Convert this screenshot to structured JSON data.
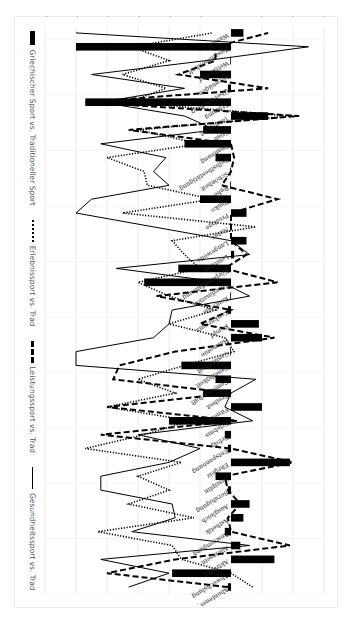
{
  "chart_data": {
    "type": "bar+line",
    "orientation": "rotated 90 degrees clockwise in the screenshot",
    "title": "",
    "xlabel": "",
    "ylabel": "",
    "ylim": [
      -0.6,
      0.3
    ],
    "yticks": [
      "0,3",
      "0,2",
      "0,1",
      "0",
      "-0,1",
      "-0,2",
      "-0,3",
      "-0,4",
      "-0,5",
      "-0,6"
    ],
    "grid": true,
    "legend_position": "bottom (left side after rotation)",
    "legend": [
      {
        "name": "Griechischer Sport vs. Traditioneller Sport",
        "style": "bar"
      },
      {
        "name": "Erlebnissport vs. Trad",
        "style": "dotted-line"
      },
      {
        "name": "Leistungssport vs. Trad",
        "style": "dashed-line"
      },
      {
        "name": "Gesundheitssport vs. Trad",
        "style": "solid-line"
      }
    ],
    "categories": [
      "Abenteuer_Wagnis",
      "Abwechslung",
      "Aktivität",
      "Alleinsein",
      "Anstrengung",
      "Ästhetik",
      "Ausgleich",
      "Beruhigung",
      "Disziplin",
      "Ehrgeiz",
      "Entspannung",
      "Erfolg",
      "Erlebnis",
      "Fitness",
      "Freiheit",
      "Gemeinschaft",
      "Geselligkeit",
      "Gesundheit",
      "Harmonie",
      "Kampf",
      "Konkurrenz",
      "Kontrolle",
      "Koordination",
      "Körpererfahrung",
      "Leistung",
      "Langeweile",
      "Natur",
      "Prestige",
      "Risiko",
      "Ruhe",
      "Schönheit",
      "Selbstbestätigung",
      "Spannung",
      "Spaß",
      "Teamgeist",
      "Training",
      "Überwindung",
      "Vergnügen",
      "Wettkampf",
      "Zusammenhalt",
      "Wasser"
    ],
    "series": [
      {
        "name": "Griechischer Sport vs. Traditioneller Sport",
        "type": "bar",
        "values": [
          -0.01,
          -0.19,
          0.14,
          0.03,
          -0.02,
          0.04,
          0.06,
          -0.01,
          -0.05,
          0.19,
          -0.01,
          -0.02,
          -0.2,
          0.1,
          -0.09,
          -0.05,
          -0.16,
          0.0,
          0.1,
          0.09,
          -0.01,
          0.0,
          -0.28,
          -0.17,
          0.01,
          0.05,
          0.0,
          0.05,
          -0.1,
          0.0,
          0.0,
          -0.05,
          -0.15,
          -0.09,
          0.12,
          -0.47,
          -0.01,
          -0.1,
          0.0,
          -0.5,
          0.04
        ]
      },
      {
        "name": "Erlebnissport vs. Trad",
        "type": "line",
        "style": "dotted",
        "values": [
          0.07,
          0.0,
          -0.16,
          -0.19,
          -0.43,
          -0.12,
          -0.33,
          -0.2,
          -0.3,
          -0.16,
          -0.47,
          -0.28,
          -0.13,
          -0.4,
          -0.18,
          -0.3,
          -0.15,
          0.01,
          -0.02,
          -0.2,
          -0.05,
          -0.2,
          -0.3,
          -0.1,
          -0.15,
          -0.19,
          0.08,
          -0.35,
          -0.06,
          -0.27,
          -0.28,
          -0.4,
          -0.1,
          -0.3,
          0.19,
          -0.33,
          -0.21,
          -0.35,
          -0.2,
          -0.32,
          -0.06
        ]
      },
      {
        "name": "Leistungssport vs. Trad",
        "type": "line",
        "style": "dashed",
        "values": [
          -0.01,
          -0.4,
          -0.18,
          0.19,
          0.0,
          -0.01,
          0.03,
          -0.01,
          -0.02,
          0.2,
          0.0,
          -0.42,
          0.02,
          -0.4,
          0.0,
          -0.38,
          -0.36,
          -0.18,
          0.14,
          -0.1,
          0.0,
          -0.24,
          0.15,
          -0.02,
          0.05,
          0.0,
          0.0,
          0.0,
          0.15,
          -0.03,
          0.0,
          0.01,
          0.0,
          -0.33,
          0.22,
          -0.47,
          0.12,
          -0.17,
          -0.05,
          -0.05,
          0.12
        ]
      },
      {
        "name": "Gesundheitssport vs. Trad",
        "type": "line",
        "style": "solid",
        "values": [
          -0.33,
          -0.2,
          -0.42,
          0.06,
          -0.32,
          -0.18,
          -0.19,
          -0.42,
          -0.42,
          -0.2,
          -0.1,
          -0.3,
          0.07,
          -0.02,
          0.0,
          0.08,
          -0.5,
          -0.5,
          -0.25,
          -0.2,
          -0.19,
          0.06,
          -0.03,
          -0.37,
          0.06,
          0.0,
          -0.25,
          -0.5,
          -0.45,
          -0.2,
          -0.25,
          -0.21,
          -0.42,
          -0.05,
          -0.15,
          -0.42,
          -0.15,
          -0.45,
          -0.08,
          0.25,
          -0.5
        ]
      }
    ]
  },
  "legend": {
    "item_1": "Griechischer Sport vs. Traditioneller Sport",
    "item_2": "Erlebnissport vs. Trad",
    "item_3": "Leistungssport vs. Trad",
    "item_4": "Gesundheitssport vs. Trad"
  }
}
